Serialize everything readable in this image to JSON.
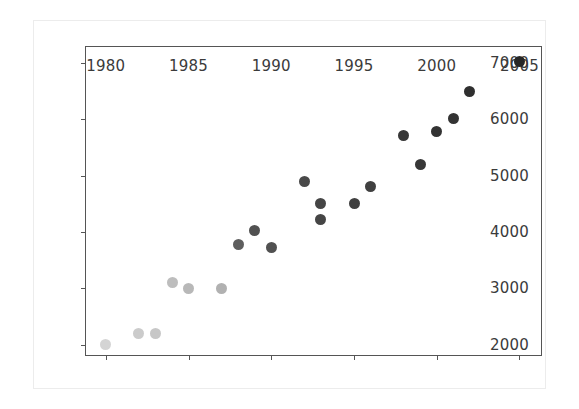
{
  "figure": {
    "background_color": "#ffffff",
    "border_color": "#ececec",
    "axes_color": "#555555",
    "marker_color": "#262626",
    "tick_label_color": "#3b3b3b"
  },
  "chart_data": {
    "type": "scatter",
    "title": "",
    "xlabel": "",
    "ylabel": "",
    "xlim": [
      1978.8,
      2006.3
    ],
    "ylim": [
      1820,
      7280
    ],
    "grid": false,
    "legend": null,
    "xticks": [
      1980,
      1985,
      1990,
      1995,
      2000,
      2005
    ],
    "yticks": [
      2000,
      3000,
      4000,
      5000,
      6000,
      7000
    ],
    "xtick_labels": [
      "1980",
      "1985",
      "1990",
      "1995",
      "2000",
      "2005"
    ],
    "ytick_labels": [
      "2000",
      "3000",
      "4000",
      "5000",
      "6000",
      "7000"
    ],
    "marker": "circle",
    "marker_size": 11,
    "note": "Marker opacity increases with year (older points faded).",
    "points": [
      {
        "x": 1980,
        "y": 2000,
        "alpha": 0.2
      },
      {
        "x": 1982,
        "y": 2200,
        "alpha": 0.24
      },
      {
        "x": 1983,
        "y": 2200,
        "alpha": 0.26
      },
      {
        "x": 1984,
        "y": 3100,
        "alpha": 0.3
      },
      {
        "x": 1985,
        "y": 3000,
        "alpha": 0.33
      },
      {
        "x": 1987,
        "y": 3000,
        "alpha": 0.36
      },
      {
        "x": 1988,
        "y": 3780,
        "alpha": 0.74
      },
      {
        "x": 1989,
        "y": 4030,
        "alpha": 0.8
      },
      {
        "x": 1990,
        "y": 3720,
        "alpha": 0.8
      },
      {
        "x": 1992,
        "y": 4900,
        "alpha": 0.84
      },
      {
        "x": 1993,
        "y": 4500,
        "alpha": 0.86
      },
      {
        "x": 1993,
        "y": 4220,
        "alpha": 0.86
      },
      {
        "x": 1995,
        "y": 4500,
        "alpha": 0.88
      },
      {
        "x": 1996,
        "y": 4800,
        "alpha": 0.88
      },
      {
        "x": 1998,
        "y": 5720,
        "alpha": 0.92
      },
      {
        "x": 1999,
        "y": 5200,
        "alpha": 0.92
      },
      {
        "x": 2000,
        "y": 5780,
        "alpha": 0.94
      },
      {
        "x": 2001,
        "y": 6020,
        "alpha": 0.94
      },
      {
        "x": 2002,
        "y": 6500,
        "alpha": 0.96
      },
      {
        "x": 2005,
        "y": 7020,
        "alpha": 1.0
      }
    ]
  }
}
